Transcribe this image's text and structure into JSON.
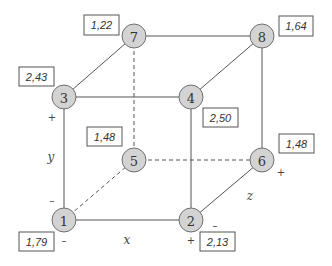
{
  "diagram": {
    "type": "cube-design-plot",
    "nodes": [
      {
        "id": "1",
        "label": "1",
        "value": "1,79"
      },
      {
        "id": "2",
        "label": "2",
        "value": "2,13"
      },
      {
        "id": "3",
        "label": "3",
        "value": "2,43"
      },
      {
        "id": "4",
        "label": "4",
        "value": "2,50"
      },
      {
        "id": "5",
        "label": "5",
        "value": "1,48"
      },
      {
        "id": "6",
        "label": "6",
        "value": "1,48"
      },
      {
        "id": "7",
        "label": "7",
        "value": "1,22"
      },
      {
        "id": "8",
        "label": "8",
        "value": "1,64"
      }
    ],
    "axes": {
      "x": {
        "label": "x",
        "minus": "–",
        "plus": "+"
      },
      "y": {
        "label": "y",
        "minus": "–",
        "plus": "+"
      },
      "z": {
        "label": "z",
        "minus": "–",
        "plus": "+"
      }
    },
    "colors": {
      "node_fill": "#d3d3d3",
      "node_stroke": "#6f6f6f",
      "edge": "#555555"
    }
  }
}
